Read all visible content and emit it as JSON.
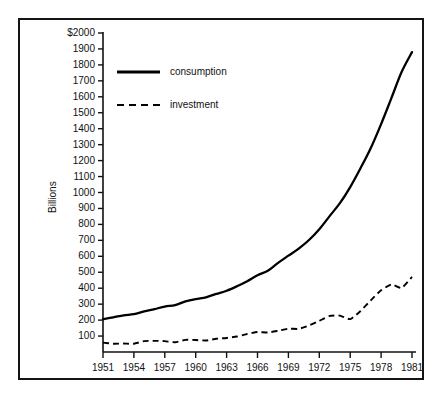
{
  "chart_data": {
    "type": "line",
    "title": "",
    "xlabel": "",
    "ylabel": "Billions",
    "y_axis_prefix": "$",
    "xlim": [
      1951,
      1981
    ],
    "ylim": [
      0,
      2000
    ],
    "grid": false,
    "legend_position": "upper-left-inside",
    "x_tick_labels": [
      "1951",
      "1954",
      "1957",
      "1960",
      "1963",
      "1966",
      "1969",
      "1972",
      "1975",
      "1978",
      "1981"
    ],
    "x_tick_values": [
      1951,
      1954,
      1957,
      1960,
      1963,
      1966,
      1969,
      1972,
      1975,
      1978,
      1981
    ],
    "y_tick_labels": [
      "$2000",
      "1900",
      "1800",
      "1700",
      "1600",
      "1500",
      "1400",
      "1300",
      "1200",
      "1100",
      "1000",
      "900",
      "800",
      "700",
      "600",
      "500",
      "400",
      "300",
      "200",
      "100"
    ],
    "y_tick_values": [
      2000,
      1900,
      1800,
      1700,
      1600,
      1500,
      1400,
      1300,
      1200,
      1100,
      1000,
      900,
      800,
      700,
      600,
      500,
      400,
      300,
      200,
      100
    ],
    "x": [
      1951,
      1952,
      1953,
      1954,
      1955,
      1956,
      1957,
      1958,
      1959,
      1960,
      1961,
      1962,
      1963,
      1964,
      1965,
      1966,
      1967,
      1968,
      1969,
      1970,
      1971,
      1972,
      1973,
      1974,
      1975,
      1976,
      1977,
      1978,
      1979,
      1980,
      1981
    ],
    "series": [
      {
        "name": "consumption",
        "style": "solid",
        "color": "#000000",
        "values": [
          206,
          217,
          230,
          237,
          255,
          269,
          285,
          294,
          317,
          332,
          343,
          364,
          384,
          412,
          444,
          481,
          509,
          559,
          604,
          648,
          702,
          770,
          852,
          933,
          1034,
          1152,
          1279,
          1429,
          1592,
          1757,
          1880
        ]
      },
      {
        "name": "investment",
        "style": "dashed",
        "color": "#000000",
        "values": [
          59,
          52,
          53,
          52,
          68,
          70,
          68,
          61,
          76,
          75,
          72,
          83,
          88,
          97,
          113,
          125,
          122,
          133,
          146,
          145,
          166,
          195,
          226,
          228,
          206,
          257,
          324,
          387,
          423,
          402,
          471
        ]
      }
    ],
    "legend": [
      {
        "label": "consumption",
        "style": "solid"
      },
      {
        "label": "investment",
        "style": "dashed"
      }
    ]
  },
  "axis_geometry": {
    "plot_left_px": 103,
    "plot_right_px": 412,
    "plot_bottom_px": 352,
    "plot_top_px": 33
  }
}
